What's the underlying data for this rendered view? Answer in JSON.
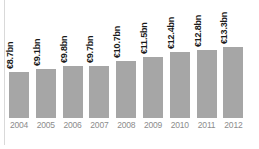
{
  "chart_data": {
    "type": "bar",
    "title": "",
    "subtitle": "",
    "xlabel": "",
    "ylabel": "",
    "grid": false,
    "legend": "none",
    "ylim": [
      0,
      14
    ],
    "categories": [
      "2004",
      "2005",
      "2006",
      "2007",
      "2008",
      "2009",
      "2010",
      "2011",
      "2012"
    ],
    "values": [
      8.7,
      9.1,
      9.8,
      9.7,
      10.7,
      11.5,
      12.4,
      12.8,
      13.3
    ],
    "value_labels": [
      "€8.7bn",
      "€9.1bn",
      "€9.8bn",
      "€9.7bn",
      "€10.7bn",
      "€11.5bn",
      "€12.4bn",
      "€12.8bn",
      "€13.3bn"
    ],
    "units": "€ bn",
    "bar_color": "#a6a6a6",
    "label_color": "#1a1a1a",
    "tick_color": "#8c8c8c",
    "axis_line_color": "#d9d9d9",
    "background": "#ffffff"
  }
}
